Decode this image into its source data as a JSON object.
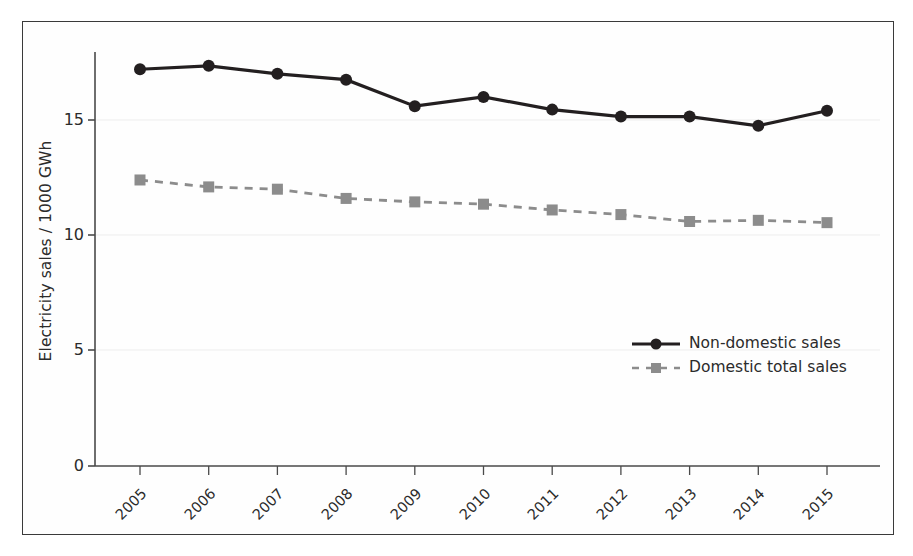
{
  "chart_data": {
    "type": "line",
    "title": "",
    "xlabel": "",
    "ylabel": "Electricity sales / 1000 GWh",
    "categories": [
      "2005",
      "2006",
      "2007",
      "2008",
      "2009",
      "2010",
      "2011",
      "2012",
      "2013",
      "2014",
      "2015"
    ],
    "x": [
      2005,
      2006,
      2007,
      2008,
      2009,
      2010,
      2011,
      2012,
      2013,
      2014,
      2015
    ],
    "series": [
      {
        "name": "Non-domestic sales",
        "marker": "circle",
        "linestyle": "solid",
        "color": "#231f20",
        "values": [
          17.2,
          17.35,
          17.0,
          16.75,
          15.6,
          16.0,
          15.45,
          15.15,
          15.15,
          14.75,
          15.4
        ]
      },
      {
        "name": "Domestic total sales",
        "marker": "square",
        "linestyle": "dashed",
        "color": "#8c8c8c",
        "values": [
          12.4,
          12.1,
          12.0,
          11.6,
          11.45,
          11.35,
          11.1,
          10.9,
          10.6,
          10.65,
          10.55
        ]
      }
    ],
    "ylim": [
      0,
      18.2
    ],
    "yticks": [
      0,
      5,
      10,
      15
    ],
    "ytick_labels": [
      "0",
      "5",
      "10",
      "15"
    ],
    "grid": true,
    "grid_axis": "y",
    "legend_position": "center-right"
  },
  "axes": {
    "y_label": "Electricity sales / 1000 GWh",
    "y_tick_labels": [
      "15",
      "10",
      "5",
      "0"
    ],
    "x_tick_labels": [
      "2005",
      "2006",
      "2007",
      "2008",
      "2009",
      "2010",
      "2011",
      "2012",
      "2013",
      "2014",
      "2015"
    ]
  },
  "legend": {
    "items": [
      {
        "label": "Non-domestic sales",
        "icon": "solid-line-circle-marker-icon"
      },
      {
        "label": "Domestic total sales",
        "icon": "dashed-line-square-marker-icon"
      }
    ]
  },
  "colors": {
    "series_1": "#231f20",
    "series_2": "#8c8c8c",
    "axis": "#4a4a4a",
    "grid": "#ededed",
    "border": "#3a3a3a",
    "text": "#2b2b2b",
    "background": "#ffffff"
  }
}
